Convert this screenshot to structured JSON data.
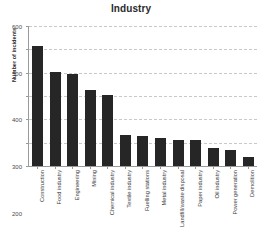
{
  "chart_data": {
    "type": "bar",
    "title": "Industry",
    "xlabel": "",
    "ylabel": "Number of incidents",
    "ylim": [
      0,
      600
    ],
    "yticks": [
      0,
      100,
      200,
      300,
      400,
      500,
      600
    ],
    "grid": true,
    "legend": false,
    "bar_color": "#262626",
    "categories": [
      "Construction",
      "Food industry",
      "Engineering",
      "Mining",
      "Chemical industry",
      "Textile industry",
      "Fuelling stations",
      "Metal industry",
      "Landfill/waste disposal",
      "Paper industry",
      "Oil industry",
      "Power generation",
      "Demolition"
    ],
    "values": [
      515,
      405,
      393,
      327,
      305,
      132,
      128,
      122,
      113,
      112,
      78,
      68,
      40
    ],
    "series": [
      {
        "name": "Number of incidents",
        "values": [
          515,
          405,
          393,
          327,
          305,
          132,
          128,
          122,
          113,
          112,
          78,
          68,
          40
        ]
      }
    ]
  },
  "axis": {
    "tick_labels": [
      "600",
      "500",
      "400",
      "300",
      "200",
      "100",
      "0"
    ]
  }
}
